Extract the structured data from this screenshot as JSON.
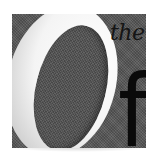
{
  "logo": {
    "large_letter": "O",
    "small_word": "the",
    "letter_f": "f",
    "colors": {
      "background": "#5a5a5a",
      "o_fill": "#ffffff",
      "text": "#0a0a0a",
      "page": "#ffffff"
    }
  }
}
